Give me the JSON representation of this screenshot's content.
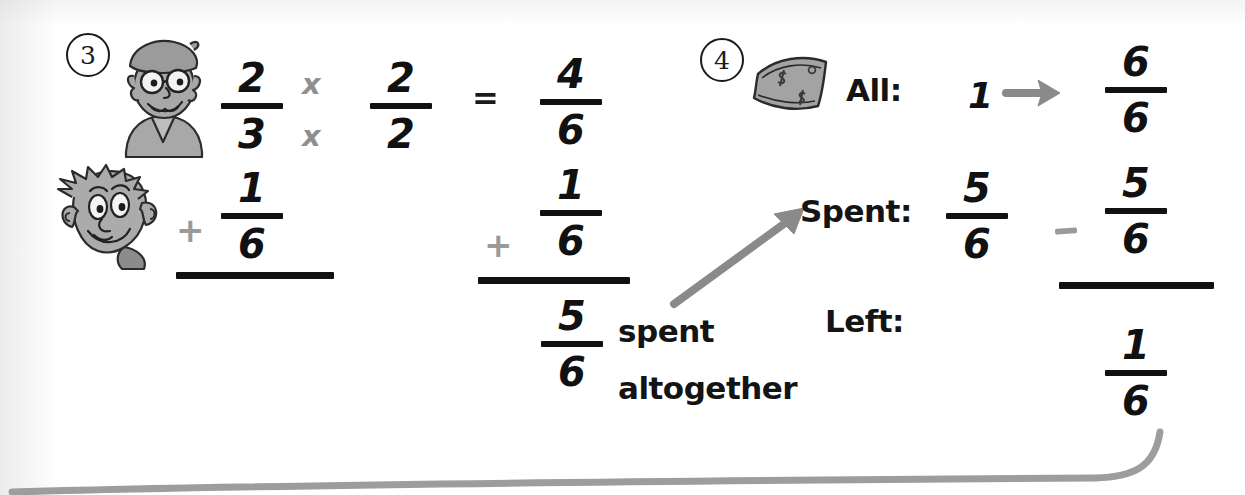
{
  "page": {
    "width": 1245,
    "height": 495,
    "background": "#ffffff",
    "ink_black": "#111111",
    "ink_gray": "#8f8f8f"
  },
  "problem3": {
    "number": "3",
    "character_top": "bearded-man-with-beret-icon",
    "character_bottom": "bald-man-big-ears-icon",
    "equation": {
      "row1": {
        "fraction_a": {
          "numerator": "2",
          "denominator": "3"
        },
        "operator_top": "x",
        "operator_bottom": "x",
        "fraction_b": {
          "numerator": "2",
          "denominator": "2"
        },
        "equals": "=",
        "fraction_result": {
          "numerator": "4",
          "denominator": "6"
        }
      },
      "row2": {
        "plus_left": "+",
        "fraction_left": {
          "numerator": "1",
          "denominator": "6"
        },
        "plus_right": "+",
        "fraction_right": {
          "numerator": "1",
          "denominator": "6"
        }
      },
      "sum": {
        "numerator": "5",
        "denominator": "6"
      }
    },
    "annotation": {
      "line1": "spent",
      "line2": "altogether"
    }
  },
  "problem4": {
    "number": "4",
    "money_icon": "dollar-bill-icon",
    "rows": [
      {
        "label": "All:",
        "value": "1",
        "arrow": "right-arrow-icon",
        "fraction": {
          "numerator": "6",
          "denominator": "6"
        }
      },
      {
        "label": "Spent:",
        "fraction_left": {
          "numerator": "5",
          "denominator": "6"
        },
        "operator": "-",
        "fraction_right": {
          "numerator": "5",
          "denominator": "6"
        }
      },
      {
        "label": "Left:",
        "fraction": {
          "numerator": "1",
          "denominator": "6"
        }
      }
    ]
  },
  "decoration": {
    "bottom_curve": "curved-gray-swoosh-line"
  }
}
